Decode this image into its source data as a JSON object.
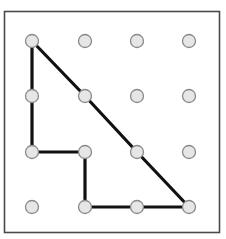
{
  "geoboard": {
    "title": "",
    "grid": {
      "columns": 4,
      "rows": 4
    },
    "border": {
      "x": 4.5,
      "y": 11.5,
      "width": 215,
      "height": 221,
      "color": "#4a4a4a"
    },
    "column_x": [
      32,
      85,
      137,
      189
    ],
    "row_y": [
      41,
      96,
      152,
      207
    ],
    "peg": {
      "radius": 6.5,
      "fill": "#e6e6e6",
      "stroke": "#8a8a8a"
    },
    "shape": {
      "color": "#111111",
      "stroke_width": 3.2,
      "vertices": [
        [
          0,
          0
        ],
        [
          0,
          1
        ],
        [
          0,
          2
        ],
        [
          1,
          2
        ],
        [
          1,
          3
        ],
        [
          2,
          3
        ],
        [
          3,
          3
        ],
        [
          2,
          2
        ],
        [
          1,
          1
        ],
        [
          0,
          0
        ]
      ]
    }
  }
}
